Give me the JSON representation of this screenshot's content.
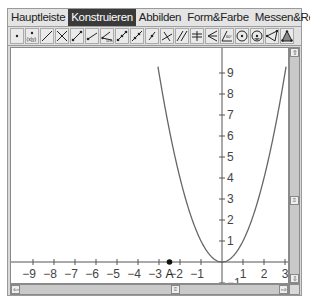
{
  "menubar": {
    "tabs": [
      {
        "label": "Hauptleiste",
        "active": false
      },
      {
        "label": "Konstruieren",
        "active": true
      },
      {
        "label": "Abbilden",
        "active": false
      },
      {
        "label": "Form&Farbe",
        "active": false
      },
      {
        "label": "Messen&Rechnen",
        "active": false
      }
    ],
    "window_buttons": [
      {
        "name": "minimize",
        "glyph": "_"
      },
      {
        "name": "restore",
        "glyph": "❐"
      },
      {
        "name": "close",
        "glyph": "×"
      }
    ]
  },
  "toolbar": {
    "tools": [
      "point-tool-icon",
      "point-coordinates-tool-icon",
      "line-tool-icon",
      "intersection-tool-icon",
      "segment-tool-icon",
      "ray-tool-icon",
      "segment-length-tool-icon",
      "vector-tool-icon",
      "line-through-points-tool-icon",
      "midpoint-tool-icon",
      "perpendicular-tool-icon",
      "parallel-tool-icon",
      "perpendicular-bisector-tool-icon",
      "angle-bisector-tool-icon",
      "angle-tool-icon",
      "circle-center-tool-icon",
      "circle-radius-tool-icon",
      "polygon-tool-icon",
      "triangle-tool-icon"
    ]
  },
  "graph": {
    "origin_px": [
      211,
      214
    ],
    "unit_px": 21,
    "x_ticks": [
      -9,
      -8,
      -7,
      -6,
      -5,
      -4,
      -3,
      -2,
      -1,
      1,
      2,
      3
    ],
    "y_ticks": [
      1,
      2,
      3,
      4,
      5,
      6,
      7,
      8,
      9,
      -1
    ],
    "function": "y = x^2",
    "curve_color": "#666666",
    "axis_color": "#555555",
    "point": {
      "label": "A",
      "x": -2.5,
      "y": 0
    }
  },
  "scrollbars": {
    "vertical_up": "⇧",
    "vertical_down": "⇩",
    "horizontal_left": "⇦",
    "horizontal_right": "⇨",
    "thumb_glyph": "≡"
  }
}
